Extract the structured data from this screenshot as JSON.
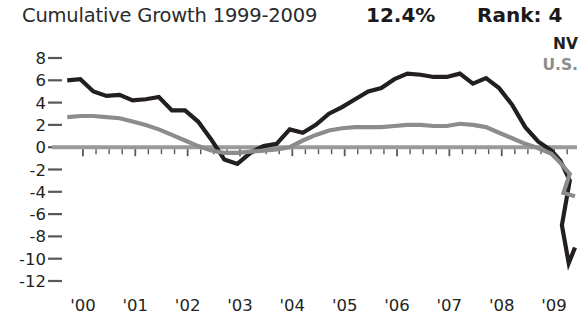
{
  "header": {
    "title": "Cumulative Growth 1999-2009",
    "value": "12.4%",
    "rank": "Rank: 4"
  },
  "legend": {
    "items": [
      {
        "label": "NV",
        "color": "#231f20"
      },
      {
        "label": "U.S.",
        "color": "#8c8c8c"
      }
    ]
  },
  "chart_data": {
    "type": "line",
    "title": "Cumulative Growth 1999-2009",
    "xlabel": "",
    "ylabel": "",
    "grid": false,
    "legend_position": "top-right",
    "ylim": [
      -12,
      8
    ],
    "yticks": [
      8,
      6,
      4,
      2,
      0,
      -2,
      -4,
      -6,
      -8,
      -10,
      -12
    ],
    "ytick_labels": [
      "8",
      "6",
      "4",
      "2",
      "0",
      "-2",
      "-4",
      "-6",
      "-8",
      "-10",
      "-12"
    ],
    "xlim": [
      1999.6,
      2009.4
    ],
    "xticks": [
      2000,
      2001,
      2002,
      2003,
      2004,
      2005,
      2006,
      2007,
      2008,
      2009
    ],
    "xtick_labels": [
      "'00",
      "'01",
      "'02",
      "'03",
      "'04",
      "'05",
      "'06",
      "'07",
      "'08",
      "'09"
    ],
    "minor_tick_interval": 0.25,
    "zero_line": 0,
    "series": [
      {
        "name": "NV",
        "color": "#231f20",
        "width": 4.2,
        "x": [
          1999.7,
          1999.95,
          2000.2,
          2000.45,
          2000.7,
          2000.95,
          2001.2,
          2001.45,
          2001.7,
          2001.95,
          2002.2,
          2002.45,
          2002.7,
          2002.95,
          2003.2,
          2003.45,
          2003.7,
          2003.95,
          2004.2,
          2004.45,
          2004.7,
          2004.95,
          2005.2,
          2005.45,
          2005.7,
          2005.95,
          2006.2,
          2006.45,
          2006.7,
          2006.95,
          2007.2,
          2007.45,
          2007.7,
          2007.95,
          2008.2,
          2008.45,
          2008.7,
          2008.95,
          2009.12,
          2009.3
        ],
        "y": [
          6.0,
          6.1,
          5.0,
          4.6,
          4.7,
          4.2,
          4.3,
          4.5,
          3.3,
          3.3,
          2.3,
          0.7,
          -1.1,
          -1.5,
          -0.5,
          0.1,
          0.3,
          1.6,
          1.3,
          2.0,
          3.0,
          3.6,
          4.3,
          5.0,
          5.3,
          6.1,
          6.6,
          6.5,
          6.3,
          6.3,
          6.6,
          5.7,
          6.2,
          5.3,
          3.8,
          1.8,
          0.5,
          -0.3,
          -1.2,
          -3.0
        ]
      },
      {
        "name": "U.S.",
        "color": "#8c8c8c",
        "width": 4.2,
        "x": [
          1999.7,
          1999.95,
          2000.2,
          2000.45,
          2000.7,
          2000.95,
          2001.2,
          2001.45,
          2001.7,
          2001.95,
          2002.2,
          2002.45,
          2002.7,
          2002.95,
          2003.2,
          2003.45,
          2003.7,
          2003.95,
          2004.2,
          2004.45,
          2004.7,
          2004.95,
          2005.2,
          2005.45,
          2005.7,
          2005.95,
          2006.2,
          2006.45,
          2006.7,
          2006.95,
          2007.2,
          2007.45,
          2007.7,
          2007.95,
          2008.2,
          2008.45,
          2008.7,
          2008.95,
          2009.12,
          2009.3
        ],
        "y": [
          2.7,
          2.8,
          2.8,
          2.7,
          2.6,
          2.3,
          2.0,
          1.6,
          1.1,
          0.6,
          0.1,
          -0.3,
          -0.5,
          -0.5,
          -0.4,
          -0.3,
          -0.2,
          0.0,
          0.6,
          1.1,
          1.5,
          1.7,
          1.8,
          1.8,
          1.8,
          1.9,
          2.0,
          2.0,
          1.9,
          1.9,
          2.1,
          2.0,
          1.8,
          1.3,
          0.8,
          0.3,
          -0.1,
          -0.6,
          -1.4,
          -2.4
        ]
      }
    ],
    "nv_tail": {
      "comment": "NV continues steeply down to trough then recovers",
      "x": [
        2009.3,
        2009.42
      ],
      "y": [
        -10.4,
        -9.0
      ]
    }
  }
}
